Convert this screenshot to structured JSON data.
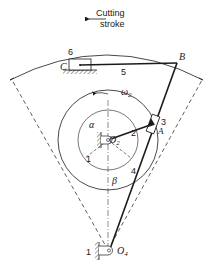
{
  "figure": {
    "type": "quick-return mechanism diagram",
    "caption": {
      "line1": "Cutting",
      "line2": "stroke"
    },
    "labels": {
      "C": "C",
      "B": "B",
      "A": "A",
      "O2_main": "O",
      "O2_sub": "2",
      "O4_main": "O",
      "O4_sub": "4",
      "omega_main": "ω",
      "omega_sub": "2",
      "alpha": "α",
      "beta": "β"
    },
    "link_numbers": {
      "frame_top": "1",
      "frame_bottom": "1",
      "crank": "2",
      "slider": "3",
      "rocker": "4",
      "coupler": "5",
      "ram": "6"
    },
    "colors": {
      "ink": "#1a1a1a",
      "background": "#ffffff"
    }
  }
}
